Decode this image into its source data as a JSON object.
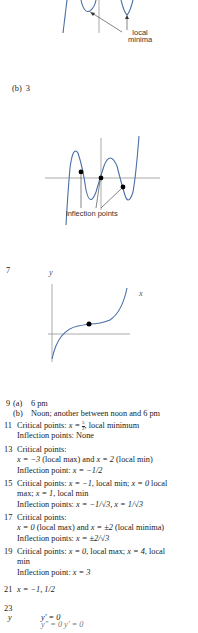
{
  "figure_top": {
    "annotation": [
      "local",
      "minima"
    ],
    "curve_color": "#4a6fa5"
  },
  "part_b": {
    "label": "(b)",
    "value": "3"
  },
  "figure_middle": {
    "annotation": "inflection points"
  },
  "problem_7": {
    "number": "7",
    "y_axis": "y",
    "x_axis": "x"
  },
  "answers": {
    "a9": {
      "number": "9",
      "part_a_label": "(a)",
      "part_a": "6 pm",
      "part_b_label": "(b)",
      "part_b": "Noon; another between noon and 6 pm"
    },
    "a11": {
      "number": "11",
      "line1_prefix": "Critical points: ",
      "line1_math": "x = ",
      "line1_frac_num": "5",
      "line1_frac_den": "2",
      "line1_suffix": ", local minimum",
      "line2": "Inflection points: None"
    },
    "a13": {
      "number": "13",
      "line1": "Critical points:",
      "line2_a": "x = −3",
      "line2_b": " (local max) and ",
      "line2_c": "x = 2",
      "line2_d": " (local min)",
      "line3_a": "Inflection point: ",
      "line3_b": "x = −1/2"
    },
    "a15": {
      "number": "15",
      "line1_a": "Critical points: ",
      "line1_b": "x = −1",
      "line1_c": ", local min; ",
      "line1_d": "x = 0",
      "line1_e": " local",
      "line2_a": "max; ",
      "line2_b": "x = 1",
      "line2_c": ", local min",
      "line3_a": "Inflection points: ",
      "line3_b": "x = −1/√3, x = 1/√3"
    },
    "a17": {
      "number": "17",
      "line1": "Critical points:",
      "line2_a": "x = 0",
      "line2_b": " (local max) and ",
      "line2_c": "x = ±2",
      "line2_d": " (local minima)",
      "line3_a": "Inflection points: ",
      "line3_b": "x = ±2/√3"
    },
    "a19": {
      "number": "19",
      "line1_a": "Critical points: ",
      "line1_b": "x = 0",
      "line1_c": ", local max; ",
      "line1_d": "x = 4",
      "line1_e": ", local",
      "line2": "min",
      "line3_a": "Inflection point: ",
      "line3_b": "x = 3"
    },
    "a21": {
      "number": "21",
      "value": "x = −1, 1/2"
    },
    "a23": {
      "number": "23",
      "y_label": "y",
      "eq1": "y′ = 0",
      "eq2_partial": "y″ = 0    y′ = 0"
    }
  }
}
